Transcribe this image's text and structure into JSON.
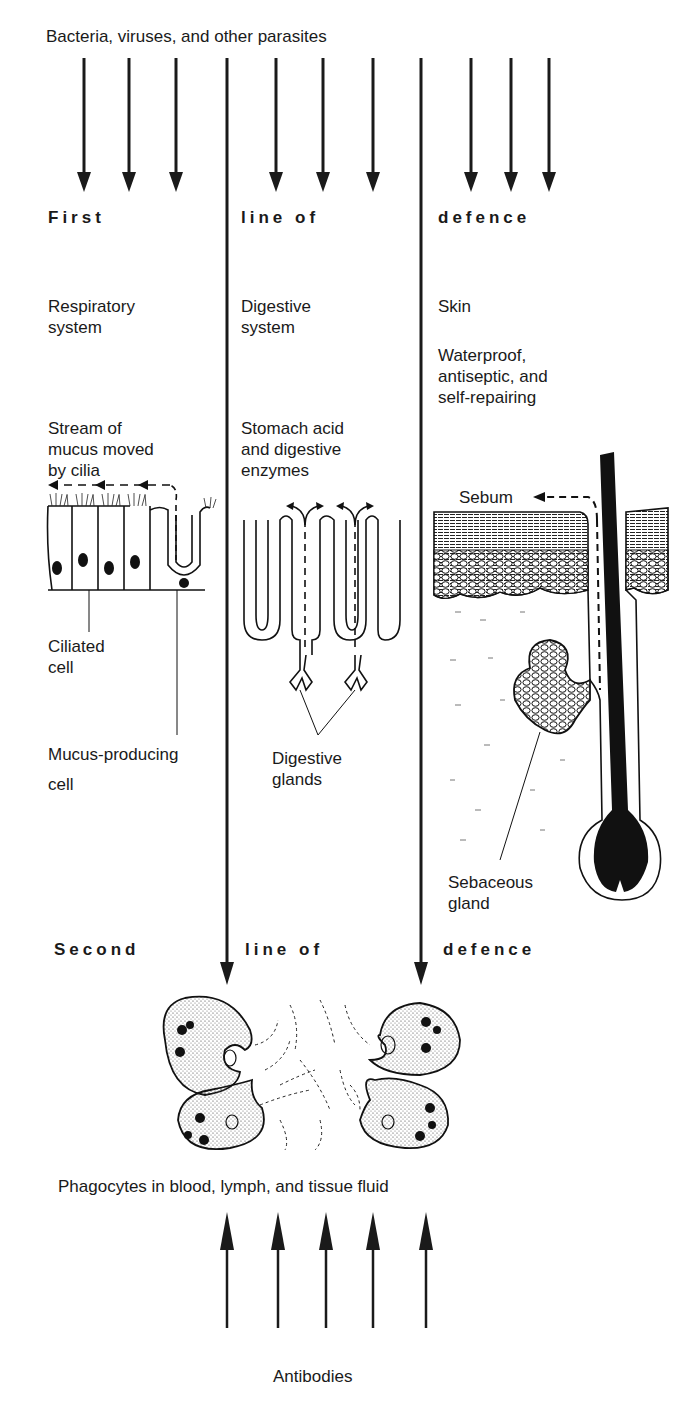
{
  "title": "Bacteria, viruses, and other parasites",
  "first_line": {
    "headings": [
      "First",
      "line of",
      "defence"
    ],
    "columns": [
      {
        "system": "Respiratory\nsystem",
        "mechanism": "Stream of\nmucus moved\nby cilia",
        "labels": [
          "Ciliated\ncell",
          "Mucus-producing\ncell"
        ]
      },
      {
        "system": "Digestive\nsystem",
        "mechanism": "Stomach acid\nand digestive\nenzymes",
        "labels": [
          "Digestive\nglands"
        ]
      },
      {
        "system": "Skin",
        "property": "Waterproof,\nantiseptic, and\nself-repairing",
        "labels": [
          "Sebum",
          "Sebaceous\ngland"
        ]
      }
    ]
  },
  "second_line": {
    "headings": [
      "Second",
      "line of",
      "defence"
    ],
    "phagocytes_caption": "Phagocytes in blood, lymph, and tissue fluid",
    "antibodies_caption": "Antibodies"
  },
  "icons": {
    "incoming_arrows": 9,
    "antibody_arrows": 5
  },
  "colors": {
    "ink": "#1a1a1a",
    "background": "#ffffff"
  }
}
